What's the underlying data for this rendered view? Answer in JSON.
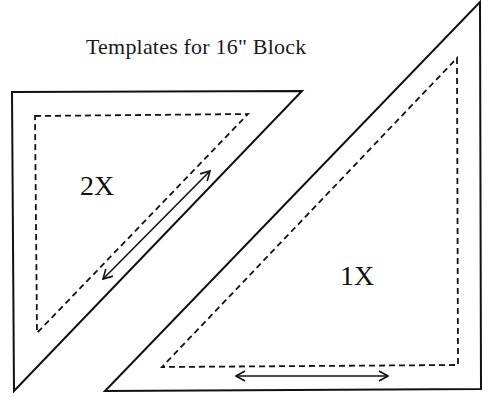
{
  "title": "Templates for 16\" Block",
  "templates": [
    {
      "id": "2x",
      "label": "2X",
      "outer": [
        [
          12,
          92
        ],
        [
          302,
          91
        ],
        [
          14,
          391
        ]
      ],
      "seam": [
        [
          35,
          116
        ],
        [
          248,
          114
        ],
        [
          37,
          333
        ]
      ],
      "grain_arrow": {
        "from": [
          210,
          171
        ],
        "to": [
          103,
          279
        ]
      }
    },
    {
      "id": "1x",
      "label": "1X",
      "outer": [
        [
          480,
          2
        ],
        [
          481,
          389
        ],
        [
          105,
          391
        ]
      ],
      "seam": [
        [
          457,
          58
        ],
        [
          458,
          365
        ],
        [
          162,
          367
        ]
      ],
      "grain_arrow": {
        "from": [
          236,
          376
        ],
        "to": [
          388,
          376
        ]
      }
    }
  ],
  "colors": {
    "line": "#111111",
    "background": "#ffffff"
  }
}
